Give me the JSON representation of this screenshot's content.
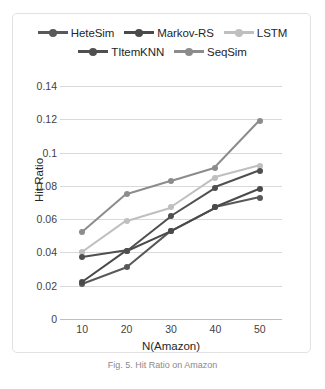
{
  "figure": {
    "caption": "Fig. 5.  Hit Ratio on Amazon"
  },
  "chart_data": {
    "type": "line",
    "title": "",
    "xlabel": "N(Amazon)",
    "ylabel": "Hit Ratio",
    "categories": [
      10,
      20,
      30,
      40,
      50
    ],
    "x_tick_labels": [
      "10",
      "20",
      "30",
      "40",
      "50"
    ],
    "y_tick_labels": [
      "0",
      "0.02",
      "0.04",
      "0.06",
      "0.08",
      "0.1",
      "0.12",
      "0.14"
    ],
    "y_tick_values": [
      0,
      0.02,
      0.04,
      0.06,
      0.08,
      0.1,
      0.12,
      0.14
    ],
    "ylim": [
      0,
      0.14
    ],
    "grid": "horizontal",
    "legend_position": "top",
    "markers": "circle",
    "series": [
      {
        "name": "HeteSim",
        "color": "#595959",
        "values": [
          0.021,
          0.031,
          0.053,
          0.067,
          0.073
        ]
      },
      {
        "name": "Markov-RS",
        "color": "#4a4a4a",
        "values": [
          0.022,
          0.041,
          0.053,
          0.067,
          0.078
        ]
      },
      {
        "name": "LSTM",
        "color": "#bfbfbf",
        "values": [
          0.04,
          0.059,
          0.067,
          0.085,
          0.092
        ]
      },
      {
        "name": "TItemKNN",
        "color": "#4f4f4f",
        "values": [
          0.037,
          0.041,
          0.062,
          0.079,
          0.089
        ]
      },
      {
        "name": "SeqSim",
        "color": "#8c8c8c",
        "values": [
          0.052,
          0.075,
          0.083,
          0.091,
          0.119
        ]
      }
    ]
  }
}
